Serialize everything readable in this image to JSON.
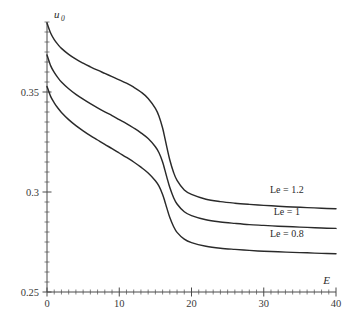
{
  "chart_data": {
    "type": "line",
    "title": "",
    "subtitle": "",
    "xlabel": "E",
    "ylabel": "u_0",
    "ylabel_base": "u",
    "ylabel_sub": "0",
    "xlim": [
      0,
      40
    ],
    "ylim": [
      0.25,
      0.385
    ],
    "grid": false,
    "legend_position": "inline-right-of-curves",
    "x_ticks_major": [
      0,
      10,
      20,
      30,
      40
    ],
    "x_tick_labels": [
      "0",
      "10",
      "20",
      "30",
      "40"
    ],
    "x_tick_minor_step": 1,
    "y_ticks_major": [
      0.25,
      0.3,
      0.35
    ],
    "y_tick_labels": [
      "0.25",
      "0.3",
      "0.35"
    ],
    "y_tick_minor_step": 0.005,
    "annotations": [
      {
        "text": "Le = 1.2",
        "x": 33.2,
        "y": 0.2995
      },
      {
        "text": "Le = 1",
        "x": 33.2,
        "y": 0.2885
      },
      {
        "text": "Le = 0.8",
        "x": 33.2,
        "y": 0.2775
      }
    ],
    "series": [
      {
        "name": "Le = 1.2",
        "label": "Le = 1.2",
        "color": "#2a2a2a",
        "x": [
          0,
          0.5,
          1,
          1.5,
          2,
          3,
          4,
          5,
          6,
          7,
          8,
          9,
          10,
          11,
          12,
          13,
          14,
          15,
          15.5,
          16,
          16.3,
          16.6,
          17,
          17.5,
          18,
          19,
          20,
          22,
          24,
          26,
          28,
          30,
          32,
          34,
          36,
          38,
          40
        ],
        "y": [
          0.3845,
          0.3795,
          0.3762,
          0.3738,
          0.3718,
          0.3688,
          0.3664,
          0.3644,
          0.3626,
          0.3609,
          0.3593,
          0.3577,
          0.3561,
          0.3544,
          0.3524,
          0.35,
          0.3468,
          0.3418,
          0.3379,
          0.332,
          0.3272,
          0.3222,
          0.316,
          0.31,
          0.3058,
          0.301,
          0.2988,
          0.2964,
          0.2952,
          0.2944,
          0.2938,
          0.2933,
          0.2929,
          0.2925,
          0.2922,
          0.2919,
          0.2916
        ]
      },
      {
        "name": "Le = 1",
        "label": "Le = 1",
        "color": "#2a2a2a",
        "x": [
          0,
          0.5,
          1,
          1.5,
          2,
          3,
          4,
          5,
          6,
          7,
          8,
          9,
          10,
          11,
          12,
          13,
          14,
          15,
          15.5,
          16,
          16.3,
          16.6,
          17,
          17.5,
          18,
          19,
          20,
          22,
          24,
          26,
          28,
          30,
          32,
          34,
          36,
          38,
          40
        ],
        "y": [
          0.3685,
          0.3632,
          0.3598,
          0.3572,
          0.355,
          0.3516,
          0.3488,
          0.3464,
          0.3442,
          0.3421,
          0.3401,
          0.3382,
          0.3362,
          0.3342,
          0.332,
          0.3296,
          0.3267,
          0.3226,
          0.3196,
          0.315,
          0.3112,
          0.3072,
          0.3022,
          0.2974,
          0.294,
          0.2901,
          0.2882,
          0.2861,
          0.285,
          0.2843,
          0.2837,
          0.2833,
          0.2829,
          0.2826,
          0.2823,
          0.282,
          0.2818
        ]
      },
      {
        "name": "Le = 0.8",
        "label": "Le = 0.8",
        "color": "#2a2a2a",
        "x": [
          0,
          0.5,
          1,
          1.5,
          2,
          3,
          4,
          5,
          6,
          7,
          8,
          9,
          10,
          11,
          12,
          13,
          14,
          15,
          15.5,
          16,
          16.3,
          16.6,
          17,
          17.5,
          18,
          19,
          20,
          22,
          24,
          26,
          28,
          30,
          32,
          34,
          36,
          38,
          40
        ],
        "y": [
          0.3528,
          0.3478,
          0.3446,
          0.342,
          0.3398,
          0.3362,
          0.3332,
          0.3306,
          0.3282,
          0.326,
          0.3238,
          0.3217,
          0.3195,
          0.3173,
          0.315,
          0.3124,
          0.3095,
          0.3056,
          0.3029,
          0.2988,
          0.2954,
          0.2918,
          0.2872,
          0.2829,
          0.2798,
          0.2764,
          0.2747,
          0.2729,
          0.2719,
          0.2713,
          0.2708,
          0.2704,
          0.2701,
          0.2698,
          0.2696,
          0.2693,
          0.2691
        ]
      }
    ]
  }
}
